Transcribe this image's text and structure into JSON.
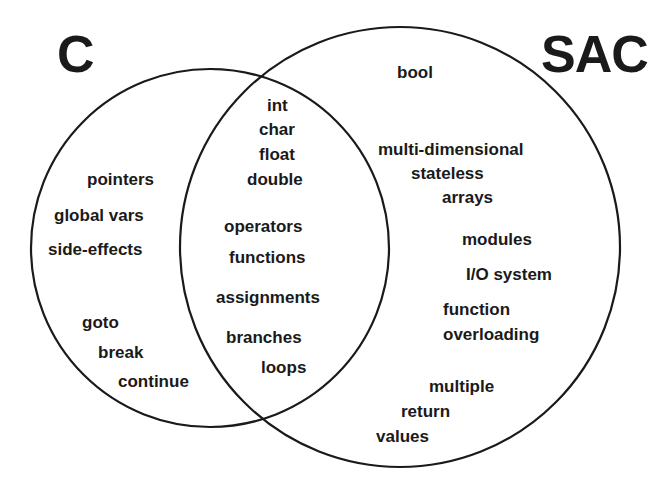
{
  "diagram": {
    "type": "venn",
    "stroke_color": "#1a1a1a",
    "sets": [
      {
        "id": "c",
        "label": "C"
      },
      {
        "id": "sac",
        "label": "SAC"
      }
    ],
    "c_only": [
      "pointers",
      "global vars",
      "side-effects",
      "goto",
      "break",
      "continue"
    ],
    "shared": [
      "int",
      "char",
      "float",
      "double",
      "operators",
      "functions",
      "assignments",
      "branches",
      "loops"
    ],
    "sac_only": [
      "bool",
      "multi-dimensional",
      "stateless",
      "arrays",
      "modules",
      "I/O system",
      "function",
      "overloading",
      "multiple",
      "return",
      "values"
    ]
  }
}
